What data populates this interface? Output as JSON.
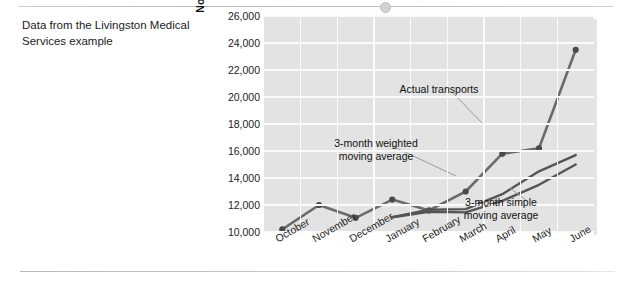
{
  "caption": "Data from the Livingston Medical Services example",
  "chart_data": {
    "type": "line",
    "title": "",
    "xlabel": "",
    "ylabel": "Nonemergency Medical Transports",
    "categories": [
      "October",
      "November",
      "December",
      "January",
      "February",
      "March",
      "April",
      "May",
      "June"
    ],
    "ylim": [
      10000,
      26000
    ],
    "ytick_step": 2000,
    "yticks": [
      "10,000",
      "12,000",
      "14,000",
      "16,000",
      "18,000",
      "20,000",
      "22,000",
      "24,000",
      "26,000"
    ],
    "ytick_values": [
      10000,
      12000,
      14000,
      16000,
      18000,
      20000,
      22000,
      24000,
      26000
    ],
    "grid": true,
    "legend_position": "inline-annotations",
    "series": [
      {
        "name": "Actual transports",
        "markers": true,
        "color": "#6b6b6b",
        "values": [
          10200,
          12000,
          11050,
          12400,
          11600,
          13000,
          15800,
          16200,
          23500
        ]
      },
      {
        "name": "3-month weighted moving average",
        "markers": false,
        "color": "#555555",
        "values": [
          null,
          null,
          null,
          11100,
          11650,
          11700,
          12800,
          14500,
          15700
        ]
      },
      {
        "name": "3-month simple moving average",
        "markers": false,
        "color": "#555555",
        "values": [
          null,
          null,
          null,
          11100,
          11500,
          11450,
          12300,
          13500,
          15000
        ]
      }
    ],
    "annotations": [
      {
        "id": "actual",
        "text_line1": "Actual transports",
        "text_line2": ""
      },
      {
        "id": "weighted",
        "text_line1": "3-month weighted",
        "text_line2": "moving average"
      },
      {
        "id": "simple",
        "text_line1": "3-month simple",
        "text_line2": "moving average"
      }
    ]
  }
}
